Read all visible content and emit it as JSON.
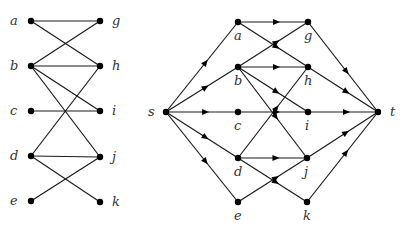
{
  "colors": {
    "edge": "#1a1a1a",
    "node": "#000000",
    "label": "#333333",
    "background": "#ffffff"
  },
  "bipartite_graph": {
    "nodes": [
      {
        "id": "a",
        "label": "a",
        "x": 31,
        "y": 21,
        "lx": 10,
        "ly": 25
      },
      {
        "id": "b",
        "label": "b",
        "x": 31,
        "y": 66,
        "lx": 10,
        "ly": 70
      },
      {
        "id": "c",
        "label": "c",
        "x": 31,
        "y": 111,
        "lx": 10,
        "ly": 115
      },
      {
        "id": "d",
        "label": "d",
        "x": 31,
        "y": 156,
        "lx": 10,
        "ly": 160
      },
      {
        "id": "e",
        "label": "e",
        "x": 31,
        "y": 201,
        "lx": 10,
        "ly": 205
      },
      {
        "id": "g",
        "label": "g",
        "x": 100,
        "y": 21,
        "lx": 112,
        "ly": 25
      },
      {
        "id": "h",
        "label": "h",
        "x": 100,
        "y": 66,
        "lx": 112,
        "ly": 70
      },
      {
        "id": "i",
        "label": "i",
        "x": 100,
        "y": 111,
        "lx": 112,
        "ly": 115
      },
      {
        "id": "j",
        "label": "j",
        "x": 100,
        "y": 157,
        "lx": 112,
        "ly": 161
      },
      {
        "id": "k",
        "label": "k",
        "x": 100,
        "y": 202,
        "lx": 112,
        "ly": 206
      }
    ],
    "edges": [
      [
        "a",
        "g"
      ],
      [
        "a",
        "h"
      ],
      [
        "b",
        "g"
      ],
      [
        "b",
        "h"
      ],
      [
        "b",
        "i"
      ],
      [
        "b",
        "j"
      ],
      [
        "c",
        "i"
      ],
      [
        "d",
        "h"
      ],
      [
        "d",
        "j"
      ],
      [
        "d",
        "k"
      ],
      [
        "e",
        "j"
      ]
    ]
  },
  "flow_network": {
    "nodes": [
      {
        "id": "s",
        "label": "s",
        "x": 166,
        "y": 112,
        "lx": 148,
        "ly": 116
      },
      {
        "id": "a",
        "label": "a",
        "x": 238,
        "y": 22,
        "lx": 234,
        "ly": 40
      },
      {
        "id": "b",
        "label": "b",
        "x": 238,
        "y": 67,
        "lx": 234,
        "ly": 85
      },
      {
        "id": "c",
        "label": "c",
        "x": 238,
        "y": 112,
        "lx": 234,
        "ly": 130
      },
      {
        "id": "d",
        "label": "d",
        "x": 238,
        "y": 158,
        "lx": 234,
        "ly": 176
      },
      {
        "id": "e",
        "label": "e",
        "x": 238,
        "y": 202,
        "lx": 234,
        "ly": 220
      },
      {
        "id": "g",
        "label": "g",
        "x": 308,
        "y": 22,
        "lx": 304,
        "ly": 40
      },
      {
        "id": "h",
        "label": "h",
        "x": 308,
        "y": 67,
        "lx": 304,
        "ly": 85
      },
      {
        "id": "i",
        "label": "i",
        "x": 308,
        "y": 112,
        "lx": 305,
        "ly": 130
      },
      {
        "id": "j",
        "label": "j",
        "x": 307,
        "y": 158,
        "lx": 304,
        "ly": 176
      },
      {
        "id": "k",
        "label": "k",
        "x": 307,
        "y": 202,
        "lx": 303,
        "ly": 220
      },
      {
        "id": "t",
        "label": "t",
        "x": 378,
        "y": 112,
        "lx": 390,
        "ly": 116
      }
    ],
    "edges": [
      [
        "s",
        "a"
      ],
      [
        "s",
        "b"
      ],
      [
        "s",
        "c"
      ],
      [
        "s",
        "d"
      ],
      [
        "s",
        "e"
      ],
      [
        "a",
        "g"
      ],
      [
        "a",
        "h"
      ],
      [
        "b",
        "g"
      ],
      [
        "b",
        "h"
      ],
      [
        "b",
        "i"
      ],
      [
        "b",
        "j"
      ],
      [
        "c",
        "i"
      ],
      [
        "d",
        "h"
      ],
      [
        "d",
        "j"
      ],
      [
        "d",
        "k"
      ],
      [
        "e",
        "j"
      ],
      [
        "g",
        "t"
      ],
      [
        "h",
        "t"
      ],
      [
        "i",
        "t"
      ],
      [
        "j",
        "t"
      ],
      [
        "k",
        "t"
      ]
    ]
  }
}
